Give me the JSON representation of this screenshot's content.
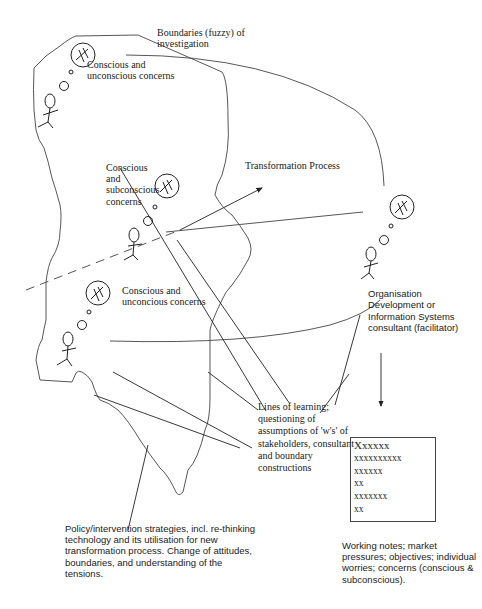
{
  "diagram": {
    "labels": {
      "boundaries": [
        "Boundaries (fuzzy) of",
        "investigation"
      ],
      "actor1_concerns": [
        "Conscious and",
        "unconscious concerns"
      ],
      "actor2_concerns": [
        "Conscious",
        "and",
        "subconscious",
        "concerns"
      ],
      "transformation": "Transformation Process",
      "actor3_concerns": [
        "Conscious and",
        "unconcious concerns"
      ],
      "consultant": [
        "Organisation",
        "Development or",
        "Information Systems",
        "consultant (facilitator)"
      ],
      "lines_of_learning": [
        "Lines of learning;",
        "questioning of",
        "assumptions of 'w's' of",
        "stakeholders, consultant",
        "and boundary",
        "constructions"
      ],
      "policy": [
        "Policy/intervention strategies, incl. re-thinking",
        "technology and its utilisation for new",
        "transformation process. Change of attitudes,",
        "boundaries, and understanding of the",
        "tensions."
      ],
      "working_notes_caption": [
        "Working notes; market",
        "pressures; objectives; individual",
        "worries; concerns (conscious &",
        "subconscious)."
      ]
    },
    "notes_box": {
      "lines": [
        "Xxxxxx",
        "xxxxxxxxxx",
        "xxxxxx",
        "xx",
        "xxxxxxx",
        "xx"
      ]
    },
    "icons": {
      "actor": "stick-figure-icon",
      "thought": "thought-bubble-icon"
    },
    "colors": {
      "stroke": "#333333",
      "text": "#222222",
      "background": "#ffffff"
    }
  }
}
